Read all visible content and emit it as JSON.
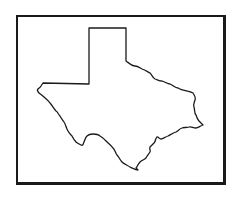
{
  "figure": {
    "subject": "Texas state outline",
    "frame_color": "#1a1a1a",
    "stroke_color": "#1a1a1a",
    "background": "#ffffff"
  }
}
